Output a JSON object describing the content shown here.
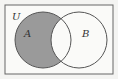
{
  "diagram": {
    "type": "venn",
    "universe_label": "U",
    "sets": [
      {
        "label": "A",
        "cx": 43,
        "cy": 40,
        "r": 28
      },
      {
        "label": "B",
        "cx": 79,
        "cy": 40,
        "r": 28
      }
    ],
    "shaded_region": "A minus B",
    "colors": {
      "background": "#f4f4f2",
      "shade": "#9a9a9a",
      "stroke": "#555555"
    }
  }
}
